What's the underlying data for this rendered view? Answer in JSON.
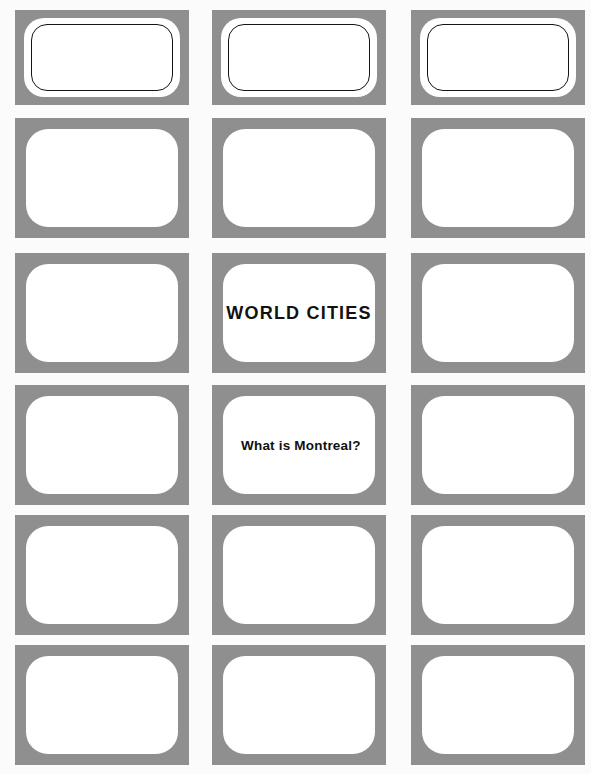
{
  "page": {
    "background_color": "#fbfbfb",
    "plate_color": "#8f8f8f",
    "card_fill_color": "#ffffff",
    "text_color": "#111111",
    "columns": 3,
    "rows": 6
  },
  "board": {
    "header_row": {
      "name": "category-header-row",
      "cells": [
        {
          "id": "cat-1",
          "label": ""
        },
        {
          "id": "cat-2",
          "label": ""
        },
        {
          "id": "cat-3",
          "label": ""
        }
      ]
    },
    "cells": [
      {
        "id": "r1c1",
        "row": 1,
        "col": 1,
        "text": "",
        "style": "clue"
      },
      {
        "id": "r1c2",
        "row": 1,
        "col": 2,
        "text": "",
        "style": "clue"
      },
      {
        "id": "r1c3",
        "row": 1,
        "col": 3,
        "text": "",
        "style": "clue"
      },
      {
        "id": "r2c1",
        "row": 2,
        "col": 1,
        "text": "",
        "style": "clue"
      },
      {
        "id": "r2c2",
        "row": 2,
        "col": 2,
        "text": "WORLD CITIES",
        "style": "category"
      },
      {
        "id": "r2c3",
        "row": 2,
        "col": 3,
        "text": "",
        "style": "clue"
      },
      {
        "id": "r3c1",
        "row": 3,
        "col": 1,
        "text": "",
        "style": "clue"
      },
      {
        "id": "r3c2",
        "row": 3,
        "col": 2,
        "text": "What is Montreal?",
        "style": "clue"
      },
      {
        "id": "r3c3",
        "row": 3,
        "col": 3,
        "text": "",
        "style": "clue"
      },
      {
        "id": "r4c1",
        "row": 4,
        "col": 1,
        "text": "",
        "style": "clue"
      },
      {
        "id": "r4c2",
        "row": 4,
        "col": 2,
        "text": "",
        "style": "clue"
      },
      {
        "id": "r4c3",
        "row": 4,
        "col": 3,
        "text": "",
        "style": "clue"
      },
      {
        "id": "r5c1",
        "row": 5,
        "col": 1,
        "text": "",
        "style": "clue"
      },
      {
        "id": "r5c2",
        "row": 5,
        "col": 2,
        "text": "",
        "style": "clue"
      },
      {
        "id": "r5c3",
        "row": 5,
        "col": 3,
        "text": "",
        "style": "clue"
      }
    ]
  },
  "geometry": {
    "columns_x": [
      15,
      212,
      411
    ],
    "column_width": 174,
    "header_y": 10,
    "header_height": 95,
    "rows_y": [
      118,
      253,
      385,
      515,
      645
    ],
    "row_height": 120
  }
}
